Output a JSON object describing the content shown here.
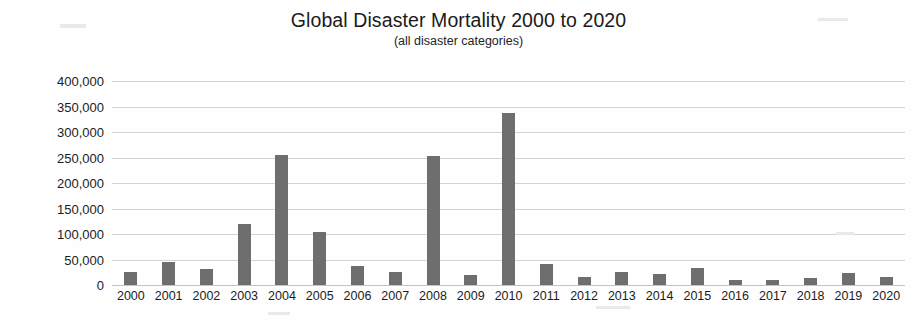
{
  "chart_data": {
    "type": "bar",
    "title": "Global Disaster Mortality 2000 to 2020",
    "subtitle": "(all disaster categories)",
    "xlabel": "",
    "ylabel": "",
    "ylim": [
      0,
      400000
    ],
    "ytick_values": [
      400000,
      350000,
      300000,
      250000,
      200000,
      150000,
      100000,
      50000,
      0
    ],
    "ytick_labels": [
      "400,000",
      "350,000",
      "300,000",
      "250,000",
      "200,000",
      "150,000",
      "100,000",
      "50,000",
      "0"
    ],
    "grid": true,
    "legend": false,
    "bar_color": "#6e6e6e",
    "categories": [
      "2000",
      "2001",
      "2002",
      "2003",
      "2004",
      "2005",
      "2006",
      "2007",
      "2008",
      "2009",
      "2010",
      "2011",
      "2012",
      "2013",
      "2014",
      "2015",
      "2016",
      "2017",
      "2018",
      "2019",
      "2020"
    ],
    "values": [
      25000,
      46000,
      31000,
      120000,
      255000,
      103000,
      37000,
      25000,
      252000,
      19000,
      337000,
      41000,
      16000,
      25000,
      21000,
      33000,
      9000,
      10000,
      14000,
      24000,
      15000
    ]
  }
}
